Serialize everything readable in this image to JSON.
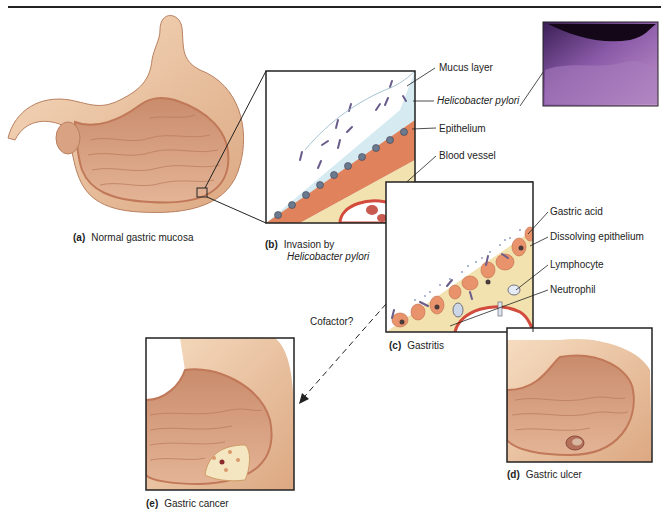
{
  "figure": {
    "panels": [
      {
        "id": "a",
        "letter": "(a)",
        "caption": "Normal gastric mucosa"
      },
      {
        "id": "b",
        "letter": "(b)",
        "caption_line1": "Invasion by",
        "caption_line2": "Helicobacter pylori"
      },
      {
        "id": "c",
        "letter": "(c)",
        "caption": "Gastritis"
      },
      {
        "id": "d",
        "letter": "(d)",
        "caption": "Gastric ulcer"
      },
      {
        "id": "e",
        "letter": "(e)",
        "caption": "Gastric cancer"
      }
    ],
    "labels_b": [
      "Mucus layer",
      "Helicobacter pylori",
      "Epithelium",
      "Blood vessel"
    ],
    "labels_c": [
      "Gastric acid",
      "Dissolving epithelium",
      "Lymphocyte",
      "Neutrophil"
    ],
    "arrow_label": "Cofactor?"
  },
  "colors": {
    "stomach_outer": "#e9c09c",
    "stomach_inner": "#d49a7a",
    "mucus": "#d6eaf2",
    "epithelium": "#e0835c",
    "submucosa": "#f2e2b0",
    "vessel": "#d24b3c",
    "bacteria": "#6a5c8a",
    "micrograph": "#7a4f9a",
    "line": "#222222"
  }
}
